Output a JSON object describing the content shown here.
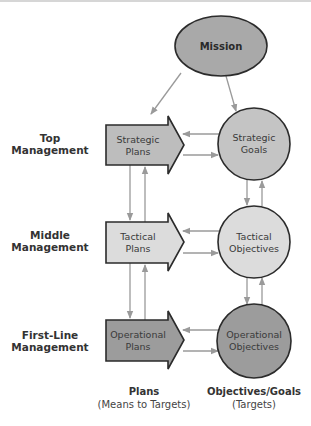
{
  "diagram": {
    "mission": {
      "label": "Mission",
      "fill": "#a9a9a9"
    },
    "levels": [
      {
        "line1": "Top",
        "line2": "Management"
      },
      {
        "line1": "Middle",
        "line2": "Management"
      },
      {
        "line1": "First-Line",
        "line2": "Management"
      }
    ],
    "plans": [
      {
        "line1": "Strategic",
        "line2": "Plans",
        "fill": "#bdbdbd"
      },
      {
        "line1": "Tactical",
        "line2": "Plans",
        "fill": "#dcdcdc"
      },
      {
        "line1": "Operational",
        "line2": "Plans",
        "fill": "#9c9c9c"
      }
    ],
    "objectives": [
      {
        "line1": "Strategic",
        "line2": "Goals",
        "fill": "#c4c4c4"
      },
      {
        "line1": "Tactical",
        "line2": "Objectives",
        "fill": "#dcdcdc"
      },
      {
        "line1": "Operational",
        "line2": "Objectives",
        "fill": "#9c9c9c"
      }
    ],
    "captions": {
      "plans_title": "Plans",
      "plans_sub": "(Means to Targets)",
      "objectives_title": "Objectives/Goals",
      "objectives_sub": "(Targets)"
    },
    "colors": {
      "outline": "#2b2b2b",
      "connector": "#9a9a9a"
    }
  }
}
